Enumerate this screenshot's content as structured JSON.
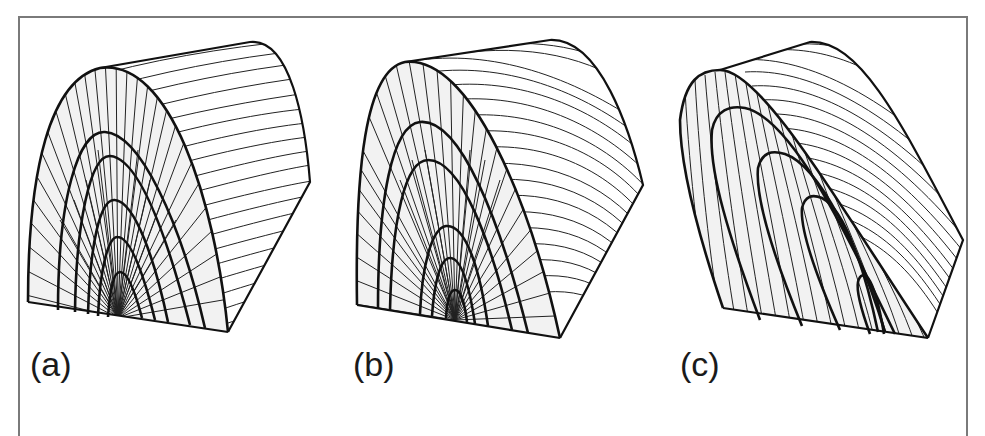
{
  "figure": {
    "panels": [
      {
        "id": "a",
        "label": "(a)",
        "label_pos": [
          30,
          347
        ]
      },
      {
        "id": "b",
        "label": "(b)",
        "label_pos": [
          353,
          347
        ]
      },
      {
        "id": "c",
        "label": "(c)",
        "label_pos": [
          680,
          347
        ]
      }
    ],
    "colors": {
      "ink": "#111111",
      "frame": "#7a7a7a",
      "face": "#f2f2f2",
      "background": "#ffffff"
    }
  }
}
